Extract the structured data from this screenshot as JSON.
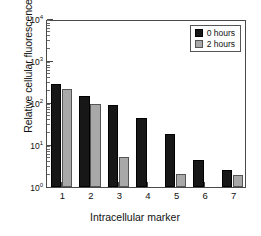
{
  "chart_data": {
    "type": "bar",
    "title": "",
    "subtitle": "",
    "xlabel": "Intracellular marker",
    "ylabel": "Relative cellular fluorescence",
    "categories": [
      "1",
      "2",
      "3",
      "4",
      "5",
      "6",
      "7"
    ],
    "series": [
      {
        "name": "0 hours",
        "color": "#171717",
        "values": [
          290,
          150,
          92,
          43,
          18,
          4.5,
          2.6
        ]
      },
      {
        "name": "2 hours",
        "color": "#a8a8a8",
        "values": [
          220,
          97,
          5.3,
          0.18,
          2.0,
          0.13,
          1.9
        ]
      }
    ],
    "yscale": "log",
    "ylim": [
      1,
      10000
    ],
    "ytick_labels": [
      "10",
      "10",
      "10",
      "10",
      "10"
    ],
    "ytick_exponents": [
      "0",
      "1",
      "2",
      "3",
      "4"
    ],
    "ytick_values": [
      1,
      10,
      100,
      1000,
      10000
    ],
    "grid": false,
    "legend_position": "top-right",
    "legend_entries": [
      "0 hours",
      "2 hours"
    ]
  },
  "axis": {
    "y_title": "Relative cellular fluorescence",
    "x_title": "Intracellular marker"
  },
  "legend": {
    "entries": [
      {
        "label": "0 hours"
      },
      {
        "label": "2 hours"
      }
    ]
  }
}
